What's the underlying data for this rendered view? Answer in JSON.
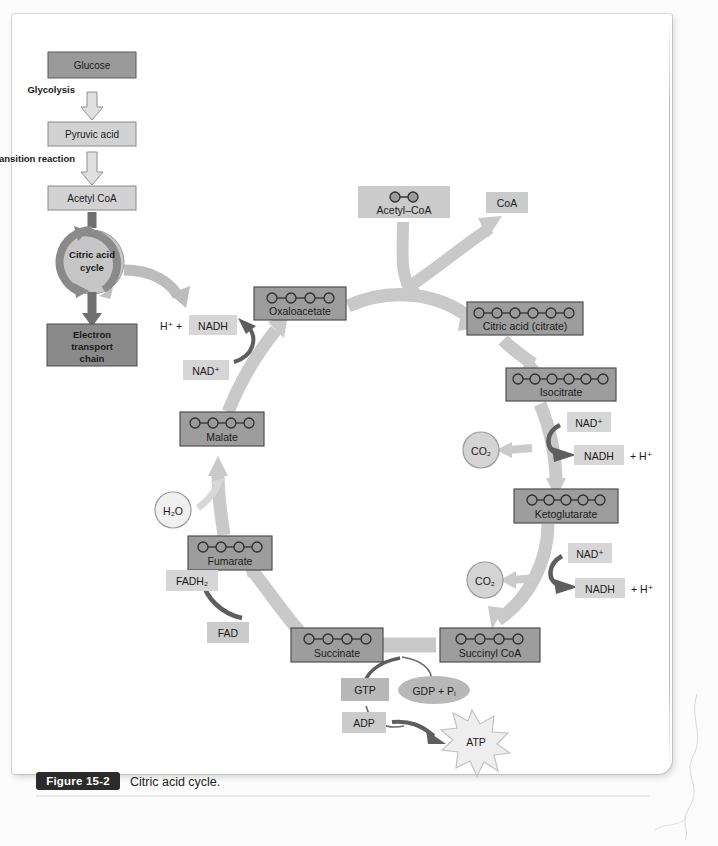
{
  "figure": {
    "number": "Figure 15-2",
    "caption": "Citric acid cycle."
  },
  "colors": {
    "box_dark": "#9a9a9a",
    "box_dark_border": "#555555",
    "box_light": "#cfcfcf",
    "box_darkest": "#8a8a8a",
    "arrow_light": "#c9c9c9",
    "arrow_dark": "#767676",
    "circle_carbon": "#8e8e8e",
    "page_white": "#ffffff"
  },
  "overview_flow": {
    "steps": [
      {
        "id": "glucose",
        "label": "Glucose",
        "style": "dark"
      },
      {
        "id": "glycolysis",
        "label": "Glycolysis",
        "style": "arrow-label"
      },
      {
        "id": "pyruvic-acid",
        "label": "Pyruvic acid",
        "style": "light"
      },
      {
        "id": "transition-reaction",
        "label": "Transition reaction",
        "style": "arrow-label"
      },
      {
        "id": "acetyl-coa",
        "label": "Acetyl CoA",
        "style": "light"
      },
      {
        "id": "citric-acid-cycle",
        "label_line1": "Citric acid",
        "label_line2": "cycle",
        "style": "circle"
      },
      {
        "id": "electron-transport-chain",
        "label_line1": "Electron",
        "label_line2": "transport",
        "label_line3": "chain",
        "style": "darkest"
      }
    ]
  },
  "cycle": {
    "metabolites": [
      {
        "id": "oxaloacetate",
        "label": "Oxaloacetate",
        "carbons": 4
      },
      {
        "id": "citric-acid",
        "label": "Citric acid (citrate)",
        "carbons": 6
      },
      {
        "id": "isocitrate",
        "label": "Isocitrate",
        "carbons": 6
      },
      {
        "id": "ketoglutarate",
        "label": "Ketoglutarate",
        "carbons": 5
      },
      {
        "id": "succinyl-coa",
        "label": "Succinyl CoA",
        "carbons": 4
      },
      {
        "id": "succinate",
        "label": "Succinate",
        "carbons": 4
      },
      {
        "id": "fumarate",
        "label": "Fumarate",
        "carbons": 4
      },
      {
        "id": "malate",
        "label": "Malate",
        "carbons": 4
      }
    ],
    "inputs": [
      {
        "id": "acetyl-coa-input",
        "label": "Acetyl–CoA",
        "carbons": 2
      },
      {
        "id": "coa-output",
        "label": "CoA"
      },
      {
        "id": "water-input",
        "label": "H₂O"
      },
      {
        "id": "fad-input",
        "label": "FAD"
      },
      {
        "id": "adp-input",
        "label": "ADP"
      }
    ],
    "cofactors": [
      {
        "id": "nad-plus-isocitrate",
        "label": "NAD⁺"
      },
      {
        "id": "nadh-isocitrate",
        "label": "NADH",
        "suffix": "+ H⁺"
      },
      {
        "id": "nad-plus-ketoglutarate",
        "label": "NAD⁺"
      },
      {
        "id": "nadh-ketoglutarate",
        "label": "NADH",
        "suffix": "+ H⁺"
      },
      {
        "id": "nad-plus-malate",
        "label": "NAD⁺"
      },
      {
        "id": "nadh-malate",
        "label": "NADH",
        "prefix": "H⁺ +"
      },
      {
        "id": "fadh2",
        "label": "FADH₂"
      }
    ],
    "byproducts": [
      {
        "id": "co2-isocitrate",
        "label": "CO₂"
      },
      {
        "id": "co2-ketoglutarate",
        "label": "CO₂"
      }
    ],
    "energy": [
      {
        "id": "gtp",
        "label": "GTP"
      },
      {
        "id": "gdp-pi",
        "label": "GDP + Pᵢ"
      },
      {
        "id": "atp",
        "label": "ATP"
      }
    ]
  }
}
